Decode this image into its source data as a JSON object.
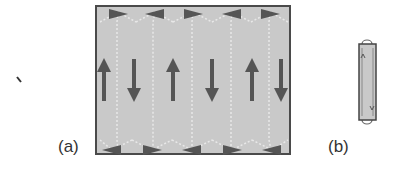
{
  "figure": {
    "panel_a_label": "(a)",
    "panel_b_label": "(b)",
    "colors": {
      "fill": "#c9c9c9",
      "border": "#4a4a4a",
      "arrow": "#555555",
      "domain_wall": "#e6e6e6"
    },
    "panel_a": {
      "top_arrows": [
        "right",
        "left",
        "right",
        "left",
        "right"
      ],
      "middle_arrows": [
        "up",
        "down",
        "up",
        "down",
        "up",
        "down"
      ],
      "bottom_arrows": [
        "left",
        "right",
        "left",
        "right",
        "left"
      ]
    },
    "panel_b": {
      "arrows": [
        "up",
        "down"
      ]
    }
  }
}
